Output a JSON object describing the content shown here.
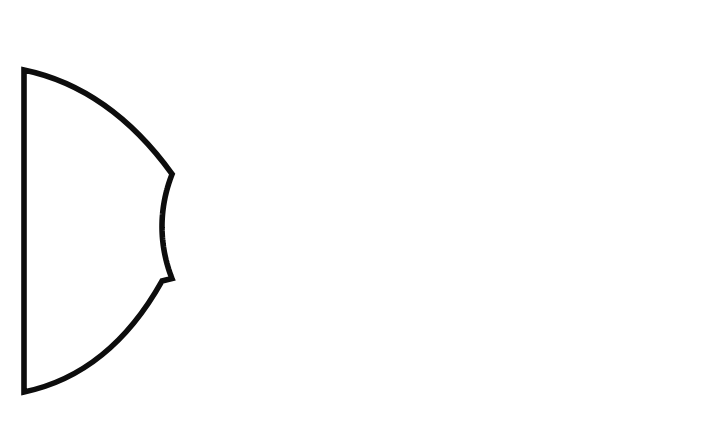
{
  "page": {
    "background_color": "#ffffff",
    "width": 718,
    "height": 426,
    "kind": "printable-craft-template"
  },
  "caption": {
    "text": "Use with \"School Of Fish\" on page 75.",
    "color": "#3b3b3b",
    "reference_page_number": "75",
    "referenced_project_title": "School Of Fish"
  },
  "artwork": {
    "title": "fish-outline-template",
    "description": "Outline drawing of a fish body with a forked tail",
    "stroke_color": "#0d0d0d",
    "fill_color": "#ffffff",
    "stroke_width": 5.6,
    "geometry": {
      "body_ellipse": {
        "left_tip_x": 162,
        "right_x": 697,
        "top_y": 34,
        "bottom_y": 419,
        "center_x": 429.5,
        "center_y": 226.5,
        "radius_x": 267.5,
        "radius_y": 192.5
      },
      "tail": {
        "left_edge_x": 24,
        "top_corner_y": 70,
        "bottom_corner_y": 392,
        "notch_top": {
          "x": 162,
          "y": 172
        },
        "notch_bottom": {
          "x": 162,
          "y": 281
        }
      }
    },
    "outline_path": "M 24.5 70.5 L 24.5 392.5 C 70 372 128 334 160 282.5 C 181 321 228 358 281 384 C 334 410 393 420.5 432 420.5 C 580 420.5 696.5 334 696.5 226.5 C 696.5 119 580 32.5 432 32.5 C 393 32.5 334 43 281 69 C 228 95 181 132 160 170.5 C 128 119 70 81 24.5 70.5 Z"
  }
}
